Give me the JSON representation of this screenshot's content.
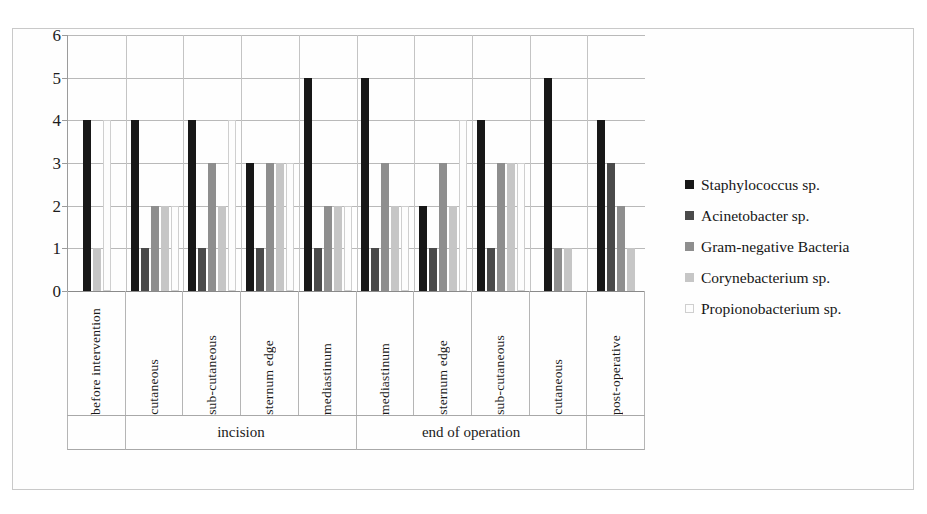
{
  "chart_data": {
    "type": "bar",
    "title": "",
    "xlabel": "",
    "ylabel": "",
    "ylim": [
      0,
      6
    ],
    "yticks": [
      0,
      1,
      2,
      3,
      4,
      5,
      6
    ],
    "ytick_labels": [
      "0",
      "1",
      "2",
      "3",
      "4",
      "5",
      "6"
    ],
    "grid": true,
    "legend_position": "right",
    "categories": [
      "before intervention",
      "cutaneous",
      "sub-cutaneous",
      "sternum edge",
      "mediastinum",
      "mediastinum",
      "sternum edge",
      "sub-cutaneous",
      "cutaneous",
      "post-operative"
    ],
    "group_spans": [
      {
        "label": "",
        "span": 1
      },
      {
        "label": "incision",
        "span": 4
      },
      {
        "label": "end of operation",
        "span": 4
      },
      {
        "label": "",
        "span": 1
      }
    ],
    "series": [
      {
        "name": "Staphylococcus sp.",
        "color": "#171717",
        "values": [
          4,
          4,
          4,
          3,
          5,
          5,
          2,
          4,
          5,
          4
        ]
      },
      {
        "name": "Acinetobacter sp.",
        "color": "#4a4a4a",
        "values": [
          0,
          1,
          1,
          1,
          1,
          1,
          1,
          1,
          0,
          3
        ]
      },
      {
        "name": "Gram-negative Bacteria",
        "color": "#8e8e8e",
        "values": [
          0,
          2,
          3,
          3,
          2,
          3,
          3,
          3,
          1,
          2
        ]
      },
      {
        "name": "Corynebacterium sp.",
        "color": "#c6c6c6",
        "values": [
          1,
          2,
          2,
          3,
          2,
          2,
          2,
          3,
          1,
          1
        ]
      },
      {
        "name": "Propionobacterium sp.",
        "color": "#fdfdfd",
        "values": [
          4,
          2,
          4,
          3,
          2,
          2,
          4,
          3,
          0,
          0
        ]
      }
    ]
  }
}
